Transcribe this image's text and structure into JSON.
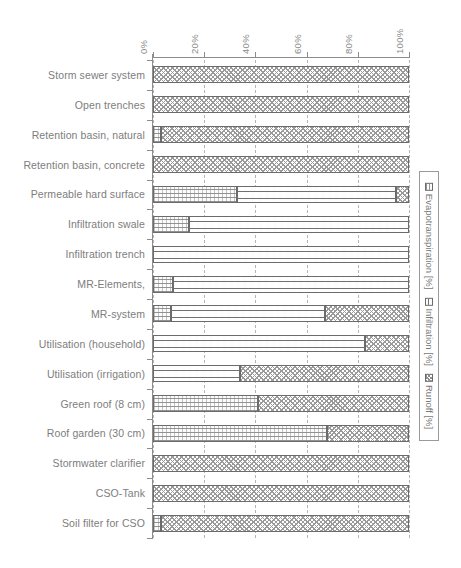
{
  "chart_data": {
    "type": "bar",
    "orientation": "horizontal",
    "stacked": true,
    "title": "",
    "xlabel": "",
    "ylabel": "",
    "xlim": [
      0,
      100
    ],
    "xticks": [
      "0%",
      "20%",
      "40%",
      "60%",
      "80%",
      "100%"
    ],
    "xtick_values": [
      0,
      20,
      40,
      60,
      80,
      100
    ],
    "grid": true,
    "grid_axis": "x",
    "legend_position": "right",
    "categories": [
      "Storm sewer system",
      "Open trenches",
      "Retention basin, natural",
      "Retention basin, concrete",
      "Permeable hard surface",
      "Infiltration swale",
      "Infiltration trench",
      "MR-Elements,",
      "MR-system",
      "Utilisation (household)",
      "Utilisation (irrigation)",
      "Green roof (8 cm)",
      "Roof  garden (30 cm)",
      "Stormwater clarifier",
      "CSO-Tank",
      "Soil filter for CSO"
    ],
    "series": [
      {
        "name": "Evapotranspiration [%]",
        "pattern": "evap",
        "values": [
          0,
          0,
          3,
          0,
          33,
          14,
          0,
          8,
          7,
          0,
          0,
          41,
          68,
          0,
          0,
          3
        ]
      },
      {
        "name": "Infiltration [%]",
        "pattern": "infil",
        "values": [
          0,
          0,
          0,
          0,
          62,
          86,
          100,
          92,
          60,
          83,
          34,
          0,
          0,
          0,
          0,
          0
        ]
      },
      {
        "name": "Runoff [%]",
        "pattern": "runoff",
        "values": [
          100,
          100,
          97,
          100,
          5,
          0,
          0,
          0,
          33,
          17,
          66,
          59,
          32,
          100,
          100,
          97
        ]
      }
    ]
  },
  "legend": {
    "entries": [
      {
        "label": "Evapotranspiration [%]",
        "pattern": "evap"
      },
      {
        "label": "Infiltration [%]",
        "pattern": "infil"
      },
      {
        "label": "Runoff [%]",
        "pattern": "runoff"
      }
    ]
  }
}
